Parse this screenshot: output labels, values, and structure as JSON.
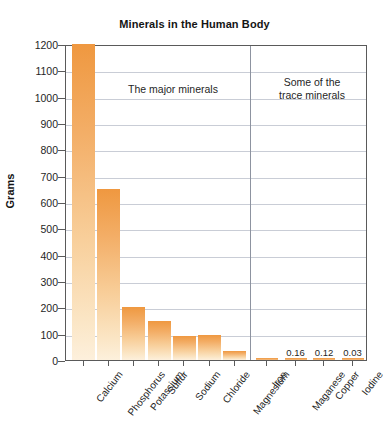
{
  "chart_data": {
    "type": "bar",
    "title": "Minerals in the Human Body",
    "xlabel": "",
    "ylabel": "Grams",
    "ylim": [
      0,
      1200
    ],
    "yticks": [
      0,
      100,
      200,
      300,
      400,
      500,
      600,
      700,
      800,
      900,
      1000,
      1100,
      1200
    ],
    "grid": true,
    "legend": "none",
    "categories": [
      "Calcium",
      "Phosphorus",
      "Potassium",
      "Sulfur",
      "Sodium",
      "Chloride",
      "Magnesium",
      "Iron",
      "Maganese",
      "Copper",
      "Iodine"
    ],
    "values": [
      1200,
      650,
      200,
      150,
      90,
      95,
      35,
      4.5,
      0.16,
      0.12,
      0.03
    ],
    "point_labels": [
      "",
      "",
      "",
      "",
      "",
      "",
      "",
      "",
      "0.16",
      "0.12",
      "0.03"
    ],
    "annotations": [
      {
        "text": "The major minerals",
        "group": "major"
      },
      {
        "text": "Some of the\ntrace minerals",
        "group": "trace"
      }
    ],
    "annotation_major": "The major minerals",
    "annotation_trace_line1": "Some of the",
    "annotation_trace_line2": "trace minerals",
    "colors": {
      "bar_top": "#ef9840",
      "bar_bottom": "#fdf0dc",
      "gridline": "#c9cdd6",
      "axis": "#5a5a5a",
      "divider": "#8d93a0",
      "text": "#1f1f1f",
      "background": "#ffffff"
    }
  },
  "axis": {
    "y_title": "Grams",
    "tick_0": "0",
    "tick_100": "100",
    "tick_200": "200",
    "tick_300": "300",
    "tick_400": "400",
    "tick_500": "500",
    "tick_600": "600",
    "tick_700": "700",
    "tick_800": "800",
    "tick_900": "900",
    "tick_1000": "1000",
    "tick_1100": "1100",
    "tick_1200": "1200"
  },
  "header": {
    "title": "Minerals in the Human Body"
  }
}
